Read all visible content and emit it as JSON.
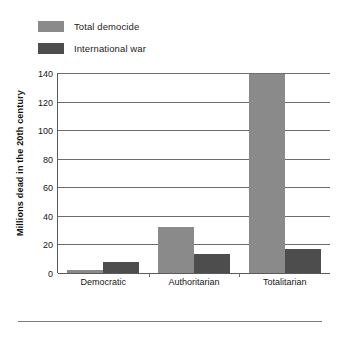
{
  "legend": {
    "items": [
      {
        "label": "Total democide",
        "color": "#8a8a8a",
        "name": "legend-swatch-total-democide"
      },
      {
        "label": "International war",
        "color": "#4d4d4d",
        "name": "legend-swatch-international-war"
      }
    ]
  },
  "axis": {
    "ylabel": "Millions dead in the 20th century",
    "yticks": [
      "0",
      "20",
      "40",
      "60",
      "80",
      "100",
      "120",
      "140"
    ]
  },
  "footer": {
    "ornament": "diamond-ornament"
  },
  "chart_data": {
    "type": "bar",
    "title": "",
    "subtitle": "",
    "xlabel": "",
    "ylabel": "Millions dead in the 20th century",
    "categories": [
      "Democratic",
      "Authoritarian",
      "Totalitarian"
    ],
    "series": [
      {
        "name": "Total democide",
        "color": "#8a8a8a",
        "values": [
          2,
          32,
          139
        ]
      },
      {
        "name": "International war",
        "color": "#4d4d4d",
        "values": [
          8,
          13,
          17
        ]
      }
    ],
    "ylim": [
      0,
      140
    ],
    "ytick_step": 20,
    "grid": true,
    "grid_axis": "y",
    "legend_position": "top-left",
    "bar_orientation": "vertical"
  }
}
